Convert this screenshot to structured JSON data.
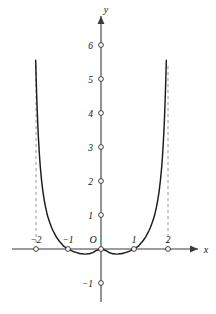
{
  "chart_data": {
    "type": "line",
    "title": "",
    "subtitle": "",
    "xlabel": "x",
    "ylabel": "y",
    "xlim": [
      -2.55,
      3.05
    ],
    "ylim": [
      -1.6,
      6.9
    ],
    "grid": false,
    "legend": null,
    "annotations": [
      {
        "name": "vertical-asymptote-left",
        "x": -2,
        "style": "dashed"
      },
      {
        "name": "vertical-asymptote-right",
        "x": 2,
        "style": "dashed"
      }
    ],
    "x_ticks": [
      {
        "value": -2,
        "label": "−2"
      },
      {
        "value": -1,
        "label": "−1"
      },
      {
        "value": 1,
        "label": "1"
      },
      {
        "value": 2,
        "label": "2"
      }
    ],
    "y_ticks": [
      {
        "value": -1,
        "label": "−1"
      },
      {
        "value": 1,
        "label": "1"
      },
      {
        "value": 2,
        "label": "2"
      },
      {
        "value": 3,
        "label": "3"
      },
      {
        "value": 4,
        "label": "4"
      },
      {
        "value": 5,
        "label": "5"
      },
      {
        "value": 6,
        "label": "6"
      }
    ],
    "origin_label": "O",
    "series": [
      {
        "name": "curve",
        "color": "#1b1b1b",
        "zeros": [
          -1,
          0,
          1
        ],
        "branches": [
          {
            "name": "left-branch",
            "x": [
              -1.98,
              -1.96,
              -1.94,
              -1.92,
              -1.9,
              -1.87,
              -1.84,
              -1.8,
              -1.76,
              -1.72,
              -1.68,
              -1.64,
              -1.6,
              -1.55,
              -1.5,
              -1.45,
              -1.4,
              -1.35,
              -1.3,
              -1.25,
              -1.2,
              -1.15,
              -1.1,
              -1.05,
              -1.0,
              -0.95,
              -0.9,
              -0.85,
              -0.8,
              -0.75,
              -0.7,
              -0.65,
              -0.6,
              -0.55,
              -0.5,
              -0.45,
              -0.4,
              -0.35,
              -0.3,
              -0.25,
              -0.2,
              -0.15,
              -0.1,
              -0.05,
              0.0
            ],
            "y": [
              5.55,
              4.85,
              4.26,
              3.76,
              3.34,
              2.83,
              2.42,
              2.01,
              1.69,
              1.44,
              1.23,
              1.06,
              0.91,
              0.77,
              0.64,
              0.53,
              0.44,
              0.35,
              0.28,
              0.21,
              0.16,
              0.1,
              0.06,
              0.03,
              0.0,
              -0.02,
              -0.05,
              -0.07,
              -0.09,
              -0.1,
              -0.12,
              -0.13,
              -0.14,
              -0.14,
              -0.15,
              -0.15,
              -0.14,
              -0.14,
              -0.12,
              -0.11,
              -0.08,
              -0.05,
              -0.03,
              -0.01,
              0.0
            ]
          },
          {
            "name": "right-branch",
            "x": [
              0.0,
              0.05,
              0.1,
              0.15,
              0.2,
              0.25,
              0.3,
              0.35,
              0.4,
              0.45,
              0.5,
              0.55,
              0.6,
              0.65,
              0.7,
              0.75,
              0.8,
              0.85,
              0.9,
              0.95,
              1.0,
              1.05,
              1.1,
              1.15,
              1.2,
              1.25,
              1.3,
              1.35,
              1.4,
              1.45,
              1.5,
              1.55,
              1.6,
              1.64,
              1.68,
              1.72,
              1.76,
              1.8,
              1.84,
              1.87,
              1.9,
              1.92,
              1.94,
              1.96,
              1.98
            ],
            "y": [
              0.0,
              -0.01,
              -0.03,
              -0.05,
              -0.08,
              -0.11,
              -0.12,
              -0.14,
              -0.14,
              -0.15,
              -0.15,
              -0.14,
              -0.14,
              -0.13,
              -0.12,
              -0.1,
              -0.09,
              -0.07,
              -0.05,
              -0.02,
              0.0,
              0.03,
              0.06,
              0.1,
              0.16,
              0.21,
              0.28,
              0.35,
              0.44,
              0.53,
              0.64,
              0.77,
              0.91,
              1.06,
              1.23,
              1.44,
              1.69,
              2.01,
              2.42,
              2.83,
              3.34,
              3.76,
              4.26,
              4.85,
              5.55
            ]
          }
        ]
      }
    ],
    "axis_arrows": {
      "x_axis": "right",
      "y_axis": "up"
    }
  },
  "labels": {
    "y_axis_name": "y",
    "x_axis_name": "x",
    "origin": "O",
    "tick_x_neg2": "−2",
    "tick_x_neg1": "−1",
    "tick_x_1": "1",
    "tick_x_2": "2",
    "tick_y_neg1": "−1",
    "tick_y_1": "1",
    "tick_y_2": "2",
    "tick_y_3": "3",
    "tick_y_4": "4",
    "tick_y_5": "5",
    "tick_y_6": "6"
  },
  "colors": {
    "curve": "#1b1b1b",
    "axis": "#3a3a3a",
    "asymptote": "#8d8d8d",
    "text": "#111111",
    "background": "#ffffff"
  }
}
